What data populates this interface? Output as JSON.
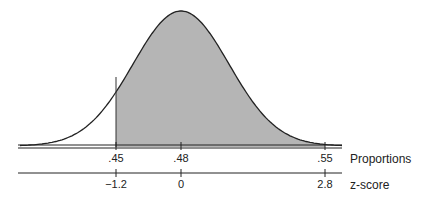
{
  "chart_data": {
    "type": "area",
    "title": "",
    "distribution": {
      "mean_proportion": 0.48,
      "mean_z": 0
    },
    "shaded_region": {
      "from_proportion": 0.45,
      "to_proportion": 0.55,
      "from_z": -1.2,
      "to_z": 2.8,
      "color": "#b5b5b5"
    },
    "axes": [
      {
        "name": "Proportions",
        "ticks": [
          ".45",
          ".48",
          ".55"
        ],
        "values": [
          0.45,
          0.48,
          0.55
        ]
      },
      {
        "name": "z-score",
        "ticks": [
          "-1.2",
          "0",
          "2.8"
        ],
        "values": [
          -1.2,
          0,
          2.8
        ]
      }
    ],
    "grid": false,
    "legend": false
  },
  "labels": {
    "proportions_axis": "Proportions",
    "zscore_axis": "z-score",
    "p_ticks": [
      ".45",
      ".48",
      ".55"
    ],
    "z_ticks": [
      "−1.2",
      "0",
      "2.8"
    ]
  },
  "colors": {
    "shade": "#b5b5b5",
    "line": "#222222"
  }
}
